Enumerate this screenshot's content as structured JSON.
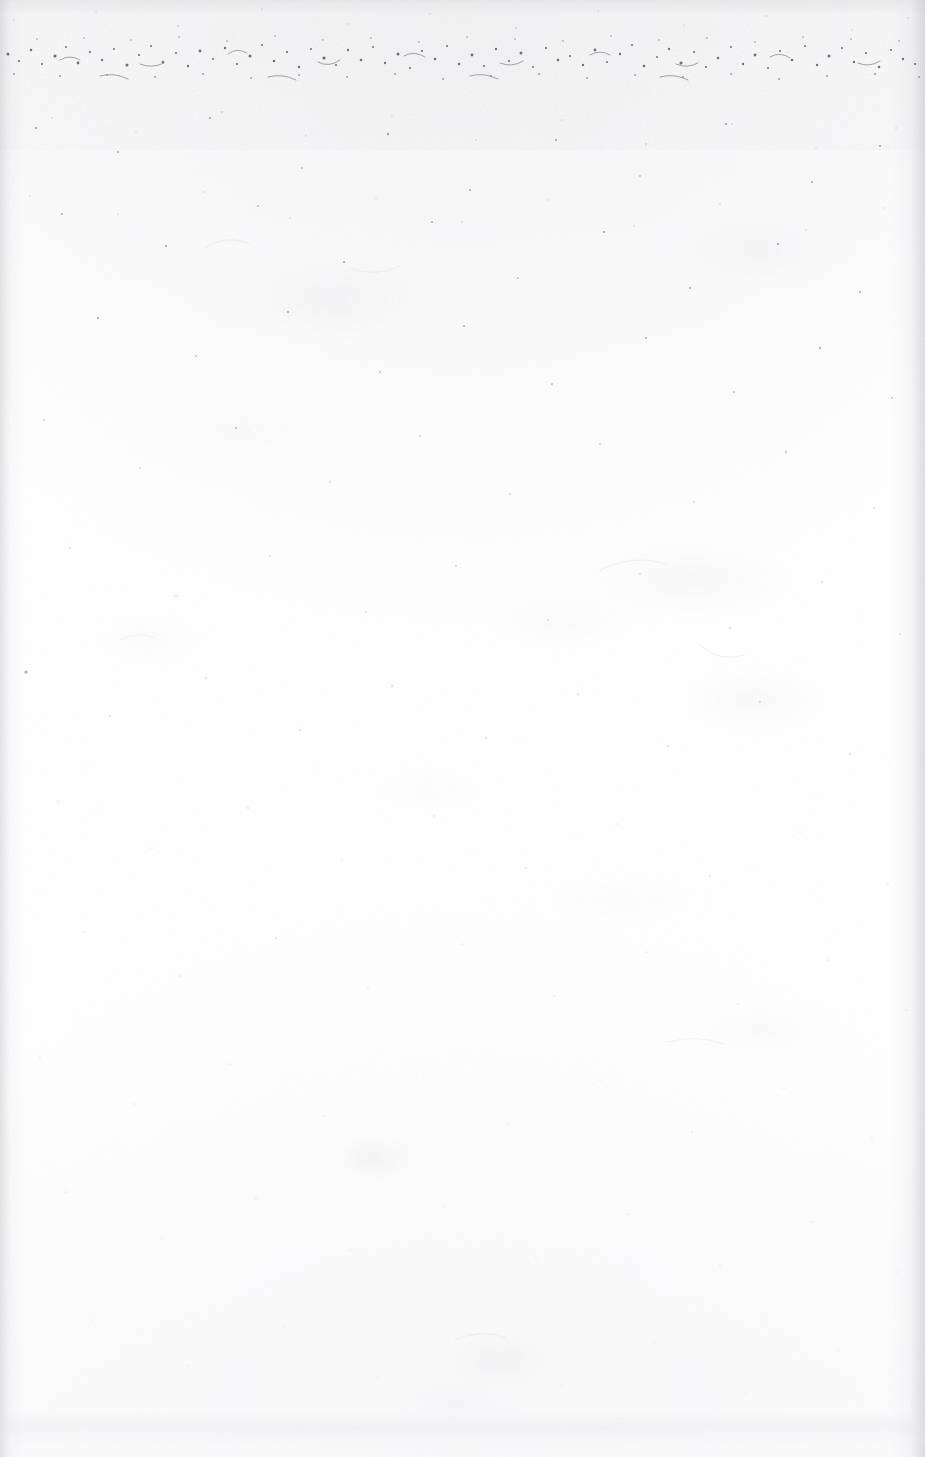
{
  "page": {
    "kind": "scanned-blank-page",
    "width": 925,
    "height": 1457,
    "visible_text": "",
    "caption": ""
  },
  "colors": {
    "paper": "#fefefe",
    "paper_shade": "#fbfbfc",
    "dust_dark": "#6f6f74",
    "dust_mid": "#a8a8ae",
    "dust_light": "#d2d2d8",
    "ghost": "#ececf0",
    "edge_shadow": "#cececf",
    "smudge": "#e2e2e6"
  },
  "artifacts": {
    "dirt_band": {
      "name": "top-edge-scanner-dirt-band",
      "top": 30,
      "height": 62,
      "density": "dense"
    },
    "edge_shadows": [
      {
        "name": "left-edge-scan-shadow",
        "side": "left",
        "width": 26
      },
      {
        "name": "right-edge-scan-shadow",
        "side": "right",
        "width": 34
      },
      {
        "name": "top-edge-scan-shadow",
        "side": "top",
        "width": 14
      }
    ],
    "bottom_smudge": {
      "name": "bottom-edge-smudge-band",
      "top": 1412,
      "height": 34
    },
    "ghost_smudges": [
      {
        "name": "ghost-smudge-upper-center",
        "cx": 330,
        "cy": 300,
        "rx": 120,
        "ry": 52,
        "opacity": 0.3
      },
      {
        "name": "ghost-smudge-upper-right",
        "cx": 760,
        "cy": 250,
        "rx": 110,
        "ry": 46,
        "opacity": 0.26
      },
      {
        "name": "ghost-smudge-mid-right",
        "cx": 690,
        "cy": 580,
        "rx": 130,
        "ry": 48,
        "opacity": 0.32
      },
      {
        "name": "ghost-smudge-mid-center",
        "cx": 560,
        "cy": 620,
        "rx": 95,
        "ry": 34,
        "opacity": 0.24
      },
      {
        "name": "ghost-smudge-mid-far-right",
        "cx": 755,
        "cy": 700,
        "rx": 90,
        "ry": 40,
        "opacity": 0.28
      },
      {
        "name": "ghost-smudge-lower-center",
        "cx": 375,
        "cy": 1158,
        "rx": 52,
        "ry": 26,
        "opacity": 0.46
      },
      {
        "name": "ghost-smudge-lower-right",
        "cx": 760,
        "cy": 1030,
        "rx": 80,
        "ry": 30,
        "opacity": 0.22
      },
      {
        "name": "ghost-smudge-bottom-center",
        "cx": 500,
        "cy": 1360,
        "rx": 70,
        "ry": 34,
        "opacity": 0.34
      },
      {
        "name": "ghost-smudge-bottom-left",
        "cx": 455,
        "cy": 1400,
        "rx": 55,
        "ry": 22,
        "opacity": 0.26
      },
      {
        "name": "ghost-smudge-left-mid",
        "cx": 150,
        "cy": 640,
        "rx": 70,
        "ry": 28,
        "opacity": 0.18
      }
    ]
  }
}
